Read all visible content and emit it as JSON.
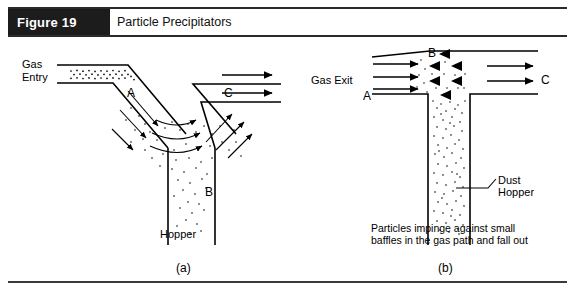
{
  "header": {
    "figure_tag": "Figure 19",
    "title": "Particle Precipitators"
  },
  "diagram_a": {
    "id": "(a)",
    "labels": {
      "gas_entry_line1": "Gas",
      "gas_entry_line2": "Entry",
      "gas_exit": "Gas Exit",
      "hopper": "Hopper",
      "zone_a": "A",
      "zone_b": "B",
      "zone_c": "C"
    }
  },
  "diagram_b": {
    "id": "(b)",
    "labels": {
      "inlet": "A",
      "baffles": "B",
      "outlet": "C",
      "dust_hopper_line1": "Dust",
      "dust_hopper_line2": "Hopper"
    },
    "caption_line1": "Particles impinge against small",
    "caption_line2": "baffles in the gas path and fall out"
  },
  "colors": {
    "ink": "#000000",
    "tag_background": "#1c1c1c",
    "tag_text": "#ffffff",
    "rule": "#2a2a2a"
  }
}
